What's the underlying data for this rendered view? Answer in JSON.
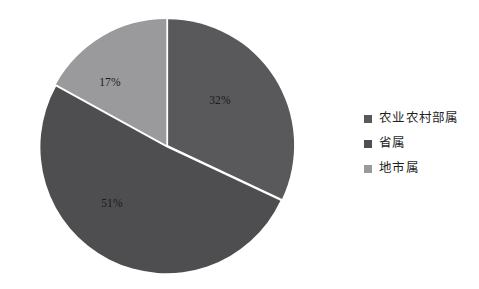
{
  "chart_data": {
    "type": "pie",
    "title": "",
    "subtitle": "",
    "xlabel": "",
    "ylabel": "",
    "grid": false,
    "legend_position": "right",
    "start_angle_deg": 0,
    "direction": "clockwise",
    "labels_shown": "percent",
    "categories": [
      "农业农村部属",
      "省属",
      "地市属"
    ],
    "values": [
      32,
      51,
      17
    ],
    "value_labels": [
      "32%",
      "51%",
      "17%"
    ],
    "colors": [
      "#59595b",
      "#4e4e50",
      "#9a9a9c"
    ],
    "separator_color": "#ffffff",
    "background": "#ffffff",
    "slices": [
      {
        "name": "农业农村部属",
        "value": 32,
        "label": "32%",
        "color": "#59595b",
        "start_deg": 0,
        "end_deg": 115.2,
        "label_x": 220,
        "label_y": 101
      },
      {
        "name": "省属",
        "value": 51,
        "label": "51%",
        "color": "#4e4e50",
        "start_deg": 115.2,
        "end_deg": 298.8,
        "label_x": 112,
        "label_y": 204
      },
      {
        "name": "地市属",
        "value": 17,
        "label": "17%",
        "color": "#9a9a9c",
        "start_deg": 298.8,
        "end_deg": 360,
        "label_x": 110,
        "label_y": 83
      }
    ]
  },
  "legend": {
    "items": [
      {
        "label": "农业农村部属",
        "color": "#59595b"
      },
      {
        "label": "省属",
        "color": "#4e4e50"
      },
      {
        "label": "地市属",
        "color": "#9a9a9c"
      }
    ]
  },
  "geometry": {
    "center_x": 167,
    "center_y": 146,
    "radius": 126,
    "explode_gap_px": 2.6
  }
}
